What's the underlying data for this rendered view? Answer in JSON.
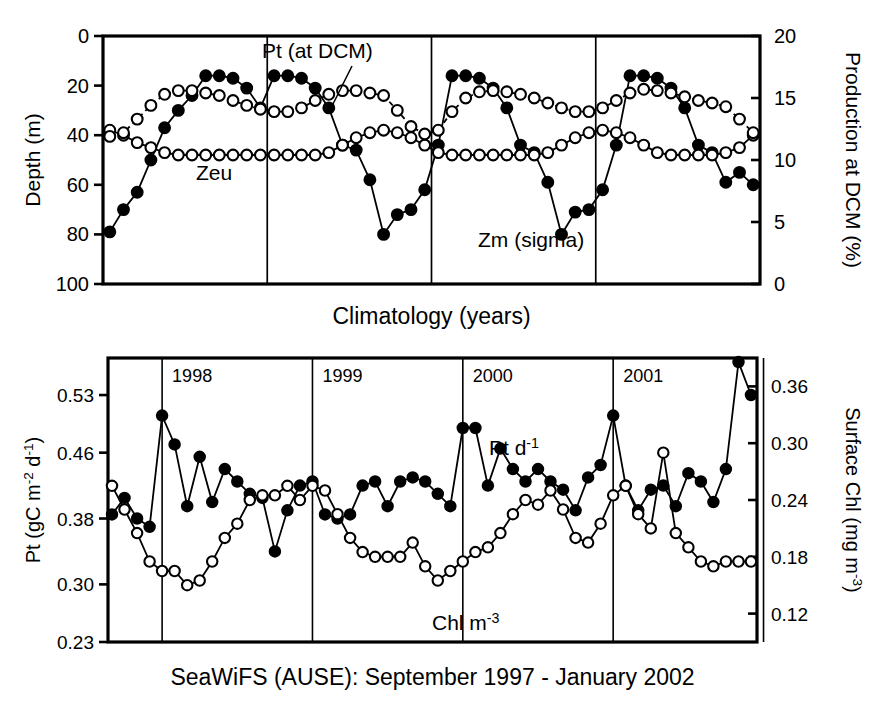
{
  "figure": {
    "background": "#ffffff",
    "ink": "#000000"
  },
  "top_panel": {
    "name": "climatology-panel",
    "xlabel": "Climatology (years)",
    "left_axis_title": "Depth (m)",
    "right_axis_title": "Production  at DCM  (%)",
    "left_ticks": [
      "0",
      "20",
      "40",
      "60",
      "80",
      "100"
    ],
    "right_ticks": [
      "20",
      "15",
      "10",
      "5",
      "0"
    ],
    "annotations": [
      {
        "id": "pt-dcm-label",
        "text": "Pt  (at DCM)"
      },
      {
        "id": "zeu-label",
        "text": "Zeu"
      },
      {
        "id": "zm-label",
        "text": "Zm (sigma)"
      }
    ]
  },
  "bottom_panel": {
    "name": "timeseries-panel",
    "caption": "SeaWiFS (AUSE): September 1997 - January 2002",
    "left_axis_title_parts": {
      "main": "Pt (gC m",
      "sup1": "-2",
      "mid": " d",
      "sup2": "-1",
      "tail": ")"
    },
    "right_axis_title_parts": {
      "main": "Surface Chl (mg m",
      "sup": "-3",
      "tail": ")"
    },
    "left_ticks": [
      "0.53",
      "0.46",
      "0.38",
      "0.30",
      "0.23"
    ],
    "right_ticks": [
      "0.36",
      "0.30",
      "0.24",
      "0.18",
      "0.12"
    ],
    "year_labels": [
      "1998",
      "1999",
      "2000",
      "2001"
    ],
    "annotations": [
      {
        "id": "pt-series-label",
        "main": "Pt d",
        "sup": "-1"
      },
      {
        "id": "chl-series-label",
        "main": "Chl m",
        "sup": "-3"
      }
    ]
  },
  "chart_data": [
    {
      "type": "line",
      "id": "climatology",
      "title": "",
      "xlabel": "Climatology (years)",
      "ylabel": "Depth (m)",
      "y2label": "Production  at DCM  (%)",
      "ylim": [
        0,
        100
      ],
      "y_inverted": true,
      "y2lim": [
        0,
        20
      ],
      "grid": false,
      "legend": "in-plot annotations",
      "x_note": "4 repeated climatological years, 12 monthly points each, vertical dividers between years",
      "x": [
        0,
        1,
        2,
        3,
        4,
        5,
        6,
        7,
        8,
        9,
        10,
        11,
        12,
        13,
        14,
        15,
        16,
        17,
        18,
        19,
        20,
        21,
        22,
        23,
        24,
        25,
        26,
        27,
        28,
        29,
        30,
        31,
        32,
        33,
        34,
        35,
        36,
        37,
        38,
        39,
        40,
        41,
        42,
        43,
        44,
        45,
        46,
        47
      ],
      "year_dividers_x": [
        11.5,
        23.5,
        35.5
      ],
      "series": [
        {
          "name": "Zm (sigma)",
          "marker": "filled-circle",
          "line": "solid",
          "axis": "left",
          "units": "m",
          "values": [
            79,
            70,
            63,
            50,
            37,
            30,
            24,
            16,
            16,
            17,
            21,
            29,
            16,
            16,
            17,
            21,
            29,
            44,
            46,
            58,
            80,
            72,
            70,
            62,
            44,
            16,
            16,
            17,
            21,
            29,
            44,
            47,
            59,
            80,
            71,
            70,
            62,
            44,
            16,
            16,
            17,
            21,
            29,
            44,
            47,
            59,
            55,
            60
          ]
        },
        {
          "name": "Zeu",
          "marker": "open-circle",
          "line": "solid",
          "axis": "left",
          "units": "m",
          "values": [
            38,
            40,
            43,
            45,
            47,
            48,
            48,
            48,
            48,
            48,
            48,
            48,
            48,
            48,
            48,
            48,
            47,
            44,
            41,
            39,
            38,
            39,
            41,
            44,
            47,
            48,
            48,
            48,
            48,
            48,
            48,
            48,
            47,
            44,
            41,
            39,
            38,
            39,
            41,
            44,
            47,
            48,
            48,
            48,
            48,
            47,
            45,
            40
          ]
        },
        {
          "name": "Pt (at DCM)",
          "marker": "open-circle",
          "line": "dashed",
          "axis": "right",
          "units": "%",
          "values": [
            11.9,
            12.2,
            13.3,
            14.4,
            15.3,
            15.6,
            15.6,
            15.4,
            15.2,
            14.8,
            14.4,
            14.1,
            13.9,
            13.9,
            14.2,
            14.8,
            15.3,
            15.6,
            15.6,
            15.4,
            15.2,
            14.0,
            12.7,
            12.1,
            12.4,
            13.9,
            15.0,
            15.5,
            15.6,
            15.5,
            15.3,
            15.0,
            14.6,
            14.2,
            13.9,
            13.9,
            14.2,
            14.8,
            15.4,
            15.7,
            15.6,
            15.4,
            15.1,
            14.8,
            14.6,
            14.3,
            13.3,
            12.2
          ]
        }
      ]
    },
    {
      "type": "line",
      "id": "seawifs-timeseries",
      "title": "SeaWiFS (AUSE): September 1997 - January 2002",
      "xlabel": "",
      "ylabel": "Pt (gC m-2 d-1)",
      "y2label": "Surface Chl (mg m-3)",
      "ylim": [
        0.23,
        0.575
      ],
      "y2lim": [
        0.09,
        0.39
      ],
      "grid": false,
      "legend": "in-plot annotations",
      "x_note": "monthly, September 1997 through January 2002; vertical dividers at year starts 1998, 1999, 2000, 2001 and at January 2002",
      "year_dividers_index": [
        4,
        16,
        28,
        40,
        52
      ],
      "series": [
        {
          "name": "Pt d-1",
          "marker": "filled-circle",
          "line": "solid",
          "axis": "left",
          "units": "gC m-2 d-1",
          "values": [
            0.385,
            0.405,
            0.38,
            0.37,
            0.505,
            0.47,
            0.395,
            0.455,
            0.4,
            0.44,
            0.425,
            0.41,
            0.405,
            0.34,
            0.39,
            0.42,
            0.425,
            0.385,
            0.38,
            0.385,
            0.42,
            0.425,
            0.395,
            0.425,
            0.43,
            0.425,
            0.41,
            0.395,
            0.49,
            0.49,
            0.42,
            0.465,
            0.44,
            0.425,
            0.44,
            0.425,
            0.415,
            0.39,
            0.43,
            0.445,
            0.505,
            0.42,
            0.39,
            0.415,
            0.42,
            0.395,
            0.435,
            0.425,
            0.4,
            0.44,
            0.57,
            0.53
          ]
        },
        {
          "name": "Chl m-3",
          "marker": "open-circle",
          "line": "solid",
          "axis": "right",
          "units": "mg m-3",
          "values": [
            0.255,
            0.23,
            0.205,
            0.175,
            0.165,
            0.165,
            0.15,
            0.155,
            0.175,
            0.2,
            0.215,
            0.24,
            0.245,
            0.245,
            0.255,
            0.24,
            0.255,
            0.25,
            0.225,
            0.2,
            0.185,
            0.18,
            0.18,
            0.18,
            0.195,
            0.17,
            0.155,
            0.165,
            0.175,
            0.185,
            0.19,
            0.205,
            0.225,
            0.24,
            0.235,
            0.25,
            0.23,
            0.2,
            0.195,
            0.215,
            0.245,
            0.255,
            0.225,
            0.21,
            0.29,
            0.205,
            0.19,
            0.175,
            0.17,
            0.175,
            0.175,
            0.175
          ]
        }
      ]
    }
  ]
}
